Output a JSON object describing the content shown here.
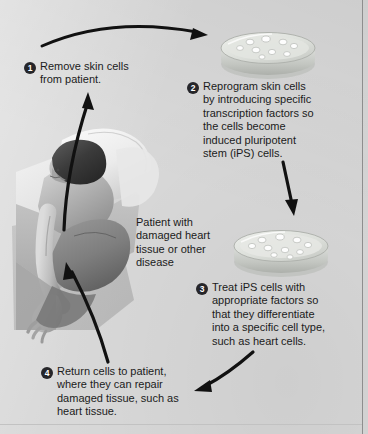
{
  "figure": {
    "background_color": "#d9d9d9",
    "badge_color": "#26262a",
    "text_color": "#1b1b1b",
    "arrow_color": "#111111"
  },
  "steps": [
    {
      "number": "1",
      "text": "Remove skin cells\nfrom patient."
    },
    {
      "number": "2",
      "text": "Reprogram skin cells\nby introducing specific\ntranscription factors so\nthe cells become\ninduced pluripotent\nstem (iPS) cells."
    },
    {
      "number": "3",
      "text": "Treat iPS cells with\nappropriate factors so\nthat they differentiate\ninto a specific cell type,\nsuch as heart cells."
    },
    {
      "number": "4",
      "text": "Return cells to patient,\nwhere they can repair\ndamaged tissue, such as\nheart tissue."
    }
  ],
  "patient_caption": "Patient with\ndamaged heart\ntissue or other\ndisease",
  "illustration": {
    "name": "patient-on-bed-illustration",
    "description": "Grayscale drawing of a patient lying on a bed with pillow, arm extended"
  },
  "petri_dishes": [
    {
      "name": "petri-dish-skin-cells",
      "cell_count": 9
    },
    {
      "name": "petri-dish-ips-cells",
      "cell_count": 10
    }
  ],
  "arrows": [
    {
      "name": "arrow-patient-to-step1",
      "direction": "up"
    },
    {
      "name": "arrow-step1-to-dish1",
      "direction": "right"
    },
    {
      "name": "arrow-dish1-to-dish2",
      "direction": "down"
    },
    {
      "name": "arrow-step3-to-step4",
      "direction": "left"
    },
    {
      "name": "arrow-step4-to-patient",
      "direction": "up-left"
    }
  ]
}
